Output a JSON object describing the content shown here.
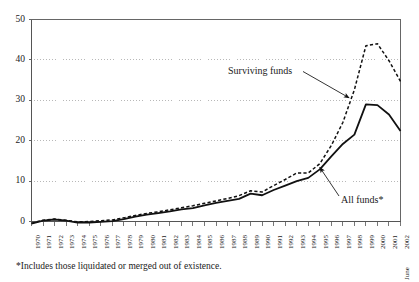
{
  "chart_data": {
    "type": "line",
    "title": "",
    "subtitle": "",
    "xlabel": "",
    "ylabel": "",
    "ylim": [
      0,
      50
    ],
    "yticks": [
      0,
      10,
      20,
      30,
      40,
      50
    ],
    "grid": "horizontal-dotted",
    "legend_position": "inline-annotations",
    "x": [
      "1970",
      "1971",
      "1972",
      "1973",
      "1974",
      "1975",
      "1976",
      "1977",
      "1978",
      "1979",
      "1980",
      "1981",
      "1982",
      "1983",
      "1984",
      "1985",
      "1986",
      "1987",
      "1988",
      "1989",
      "1990",
      "1991",
      "1992",
      "1993",
      "1994",
      "1995",
      "1996",
      "1997",
      "1998",
      "1999",
      "2000",
      "2001",
      "2002"
    ],
    "x_last_note": "June",
    "series": [
      {
        "name": "Surviving funds",
        "style": "dashed",
        "color": "#111111",
        "values": [
          -0.4,
          0.3,
          0.6,
          0.3,
          -0.1,
          0.0,
          0.2,
          0.4,
          0.9,
          1.5,
          2.0,
          2.4,
          2.9,
          3.4,
          3.9,
          4.5,
          5.1,
          5.7,
          6.4,
          7.6,
          7.3,
          8.9,
          10.4,
          12.0,
          12.0,
          14.3,
          18.8,
          24.5,
          32.6,
          43.5,
          44.0,
          39.8,
          34.7
        ]
      },
      {
        "name": "All funds*",
        "style": "solid",
        "color": "#111111",
        "values": [
          -0.5,
          0.2,
          0.5,
          0.2,
          -0.3,
          -0.3,
          -0.1,
          0.1,
          0.6,
          1.2,
          1.7,
          2.1,
          2.5,
          3.0,
          3.3,
          4.0,
          4.6,
          5.1,
          5.6,
          6.9,
          6.5,
          7.8,
          8.9,
          10.0,
          10.8,
          12.9,
          16.1,
          19.2,
          21.5,
          29.0,
          28.8,
          26.5,
          22.4
        ]
      }
    ],
    "annotations": [
      {
        "text": "Surviving funds",
        "points_to_series": "Surviving funds"
      },
      {
        "text": "All funds*",
        "points_to_series": "All funds*"
      }
    ],
    "footnote": "*Includes those liquidated or merged out of existence."
  },
  "colors": {
    "background": "#ffffff",
    "axis": "#555555",
    "grid": "#9a9a9a",
    "line": "#111111",
    "text": "#1a1a1a"
  }
}
